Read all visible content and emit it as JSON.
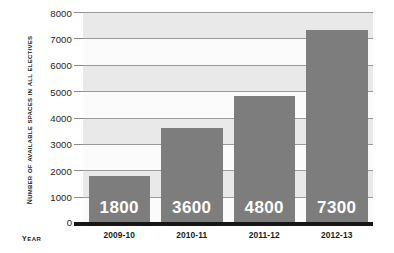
{
  "chart_data": {
    "type": "bar",
    "title": "",
    "xlabel": "Year",
    "ylabel": "Number of Available Spaces in All Electives",
    "categories": [
      "2009-10",
      "2010-11",
      "2011-12",
      "2012-13"
    ],
    "values": [
      1800,
      3600,
      4800,
      7300
    ],
    "value_labels": [
      "1800",
      "3600",
      "4800",
      "7300"
    ],
    "ylim": [
      0,
      8000
    ],
    "ytick_labels": [
      "8000",
      "7000",
      "6000",
      "5000",
      "4000",
      "3000",
      "2000",
      "1000",
      "0"
    ],
    "ytick_values": [
      8000,
      7000,
      6000,
      5000,
      4000,
      3000,
      2000,
      1000,
      0
    ],
    "grid": true,
    "legend": "none",
    "colors": {
      "bar": "#7d7d7d",
      "plot_background": "#f2f2f2",
      "band_light": "#fbfbfb",
      "band_dark": "#e9e9e9",
      "gridline": "#9a9a9a",
      "axis_line": "#161616",
      "value_label": "#ffffff",
      "tick_text": "#262626",
      "axis_title_text": "#1c1c1c"
    }
  }
}
